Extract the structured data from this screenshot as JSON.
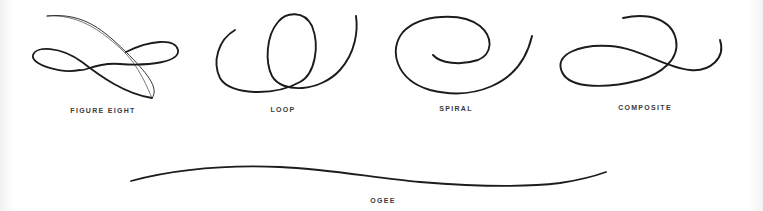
{
  "diagram": {
    "stroke_color": "#1c1c1c",
    "label_color": "#3a3a3a",
    "background": "#ffffff",
    "flourishes": [
      {
        "id": "figure-eight",
        "label": "FIGURE EIGHT"
      },
      {
        "id": "loop",
        "label": "LOOP"
      },
      {
        "id": "spiral",
        "label": "SPIRAL"
      },
      {
        "id": "composite",
        "label": "COMPOSITE"
      },
      {
        "id": "ogee",
        "label": "OGEE"
      }
    ]
  }
}
